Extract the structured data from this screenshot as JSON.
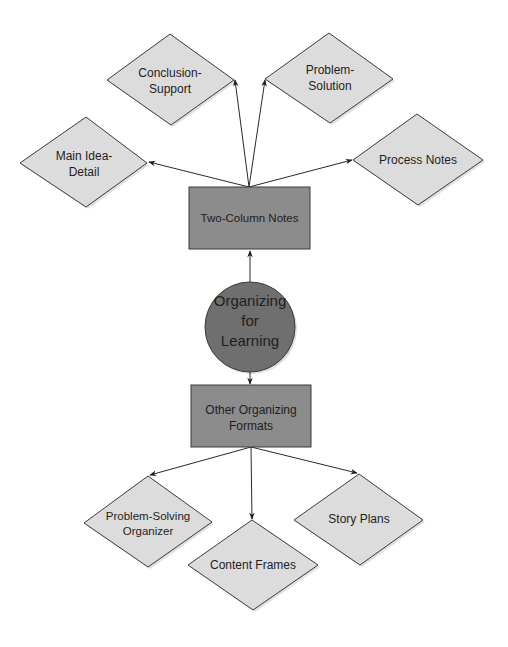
{
  "diagram": {
    "center": {
      "line1": "Organizing",
      "line2": "for",
      "line3": "Learning"
    },
    "upper_branch": {
      "label": "Two-Column Notes",
      "children": [
        {
          "line1": "Main Idea-",
          "line2": "Detail"
        },
        {
          "line1": "Conclusion-",
          "line2": "Support"
        },
        {
          "line1": "Problem-",
          "line2": "Solution"
        },
        {
          "line1": "Process Notes"
        }
      ]
    },
    "lower_branch": {
      "line1": "Other Organizing",
      "line2": "Formats",
      "children": [
        {
          "line1": "Problem-Solving",
          "line2": "Organizer"
        },
        {
          "line1": "Content Frames"
        },
        {
          "line1": "Story Plans"
        }
      ]
    }
  },
  "colors": {
    "hub": "#6f6f6f",
    "box": "#8c8c8c",
    "diamond": "#dcdcdc",
    "stroke": "#3a3a3a"
  }
}
